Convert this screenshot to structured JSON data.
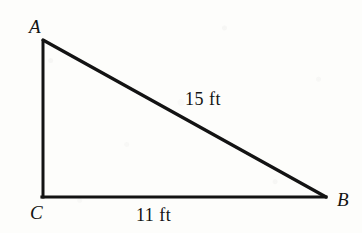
{
  "figure": {
    "type": "right-triangle",
    "background_color": "#fdfdfb",
    "stroke_color": "#131313",
    "stroke_width": 3,
    "vertices": [
      {
        "name": "A",
        "label": "A",
        "x": 42,
        "y": 40,
        "label_x": 29,
        "label_y": 17
      },
      {
        "name": "C",
        "label": "C",
        "x": 43,
        "y": 197,
        "label_x": 30,
        "label_y": 203
      },
      {
        "name": "B",
        "label": "B",
        "x": 325,
        "y": 197,
        "label_x": 337,
        "label_y": 190
      }
    ],
    "sides": [
      {
        "name": "hypotenuse-AB",
        "label": "15 ft",
        "from": "A",
        "to": "B",
        "label_x": 185,
        "label_y": 90
      },
      {
        "name": "base-CB",
        "label": "11 ft",
        "from": "C",
        "to": "B",
        "label_x": 136,
        "label_y": 206
      },
      {
        "name": "leg-AC",
        "label": "",
        "from": "A",
        "to": "C"
      }
    ],
    "right_angle_at": "C"
  }
}
